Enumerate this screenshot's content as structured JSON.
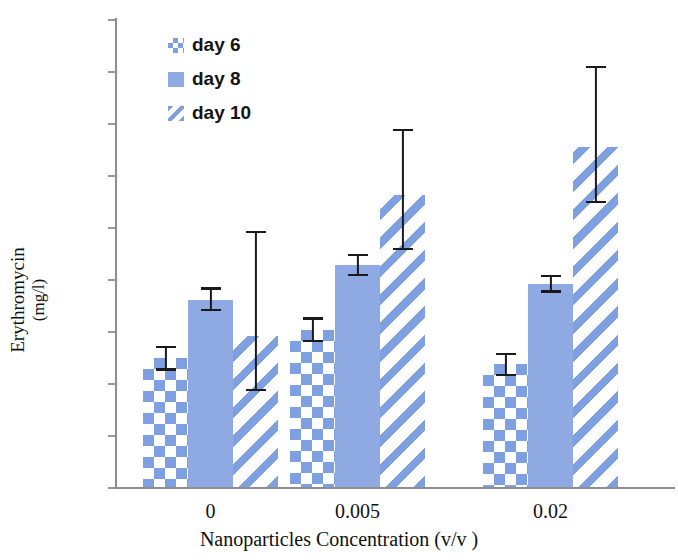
{
  "chart_data": {
    "type": "bar",
    "title": "",
    "xlabel": "Nanoparticles Concentration (v/v )",
    "ylabel_line1": "Erythromycin",
    "ylabel_line2": "(mg/l)",
    "categories": [
      "0",
      "0.005",
      "0.02"
    ],
    "ylim": [
      0,
      45
    ],
    "ytick_step": 5,
    "yticks": [
      "45",
      "40",
      "35",
      "30",
      "25",
      "20",
      "15",
      "10",
      "5",
      "0"
    ],
    "grid": false,
    "legend_position": "top-left-inside",
    "series": [
      {
        "name": "day 6",
        "pattern": "checkerboard",
        "color": "#7e9fe0",
        "values": [
          12.4,
          15.1,
          11.8
        ],
        "errors_upper": [
          13.6,
          16.3,
          12.9
        ],
        "errors_lower": [
          11.2,
          13.9,
          10.7
        ]
      },
      {
        "name": "day 8",
        "pattern": "solid",
        "color": "#8fa9e3",
        "values": [
          18.0,
          21.3,
          19.5
        ],
        "errors_upper": [
          19.2,
          22.4,
          20.4
        ],
        "errors_lower": [
          16.9,
          20.3,
          18.7
        ]
      },
      {
        "name": "day 10",
        "pattern": "diagonal-stripes",
        "color": "#7e9fe0",
        "values": [
          14.5,
          28.1,
          32.7
        ],
        "errors_upper": [
          24.6,
          34.4,
          40.5
        ],
        "errors_lower": [
          9.2,
          22.8,
          27.3
        ]
      }
    ]
  },
  "legend": {
    "items": [
      {
        "label": "day 6"
      },
      {
        "label": "day 8"
      },
      {
        "label": "day 10"
      }
    ]
  },
  "axes": {
    "y_title_line1": "Erythromycin",
    "y_title_line2": "(mg/l)",
    "x_title": "Nanoparticles Concentration (v/v )"
  }
}
